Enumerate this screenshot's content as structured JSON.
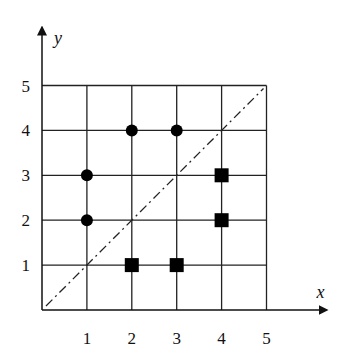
{
  "chart_data": {
    "type": "scatter",
    "title": "",
    "xlabel": "x",
    "ylabel": "y",
    "xlim": [
      0,
      5
    ],
    "ylim": [
      0,
      5
    ],
    "xticks": [
      "1",
      "2",
      "3",
      "4",
      "5"
    ],
    "yticks": [
      "1",
      "2",
      "3",
      "4",
      "5"
    ],
    "grid": true,
    "series": [
      {
        "name": "circles",
        "marker": "circle",
        "color": "#000000",
        "points": [
          [
            1,
            2
          ],
          [
            1,
            3
          ],
          [
            2,
            4
          ],
          [
            3,
            4
          ]
        ]
      },
      {
        "name": "squares",
        "marker": "square",
        "color": "#000000",
        "points": [
          [
            2,
            1
          ],
          [
            3,
            1
          ],
          [
            4,
            2
          ],
          [
            4,
            3
          ]
        ]
      }
    ],
    "reference_line": {
      "name": "y = x",
      "style": "dash-dot",
      "from": [
        0,
        0
      ],
      "to": [
        5,
        5
      ]
    }
  }
}
